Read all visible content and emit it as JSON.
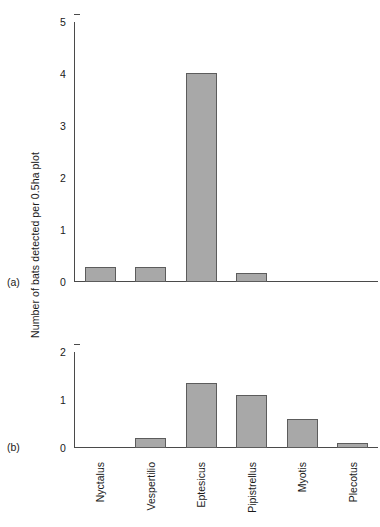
{
  "figure": {
    "ylabel": "Number of bats detected per 0.5ha plot",
    "panel_tags": [
      "(a)",
      "(b)"
    ],
    "bar_fill_color": "#a8a8a8",
    "bar_edge_color": "#5c5c5c",
    "axis_color": "#4a4a4a"
  },
  "chart_data": [
    {
      "type": "bar",
      "panel": "(a)",
      "title": "",
      "xlabel": "",
      "ylabel": "Number of bats detected per 0.5ha plot",
      "categories": [
        "Nyctalus",
        "Vespertilio",
        "Eptesicus",
        "Pipistrellus",
        "Myotis",
        "Plecotus"
      ],
      "values": [
        0.28,
        0.29,
        4.02,
        0.17,
        0,
        0
      ],
      "ylim": [
        0,
        5
      ],
      "yticks": [
        0,
        1,
        2,
        3,
        4,
        5
      ],
      "ytick_labels": [
        "0",
        "1",
        "2",
        "3",
        "4",
        "5"
      ],
      "grid": false,
      "legend": "none"
    },
    {
      "type": "bar",
      "panel": "(b)",
      "title": "",
      "xlabel": "",
      "ylabel": "Number of bats detected per 0.5ha plot",
      "categories": [
        "Nyctalus",
        "Vespertilio",
        "Eptesicus",
        "Pipistrellus",
        "Myotis",
        "Plecotus"
      ],
      "values": [
        0,
        0.2,
        1.35,
        1.1,
        0.6,
        0.1
      ],
      "ylim": [
        0,
        2
      ],
      "yticks": [
        0,
        1,
        2
      ],
      "ytick_labels": [
        "0",
        "1",
        "2"
      ],
      "grid": false,
      "legend": "none"
    }
  ]
}
